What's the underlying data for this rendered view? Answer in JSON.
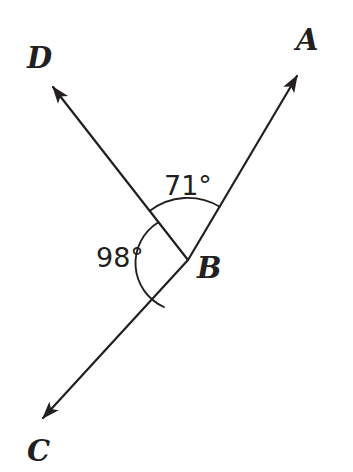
{
  "figure": {
    "type": "angle-diagram",
    "background_color": "#ffffff",
    "stroke_color": "#231f20",
    "stroke_width": 2.2
  },
  "points": {
    "vertex": {
      "label": "B",
      "x": 188,
      "y": 260
    },
    "a": {
      "label": "A",
      "x": 302,
      "y": 68
    },
    "d": {
      "label": "D",
      "x": 47,
      "y": 80
    },
    "c": {
      "label": "C",
      "x": 37,
      "y": 425
    }
  },
  "rays": [
    {
      "name": "ray-BA",
      "from": "B",
      "to": "A",
      "arrowhead": true
    },
    {
      "name": "ray-BD",
      "from": "B",
      "to": "D",
      "arrowhead": true
    },
    {
      "name": "ray-BC",
      "from": "B",
      "to": "C",
      "arrowhead": true
    }
  ],
  "angles": [
    {
      "name": "angle-DBA",
      "label": "71°",
      "value": 71,
      "unit": "degrees",
      "between": [
        "ray-BD",
        "ray-BA"
      ],
      "arc_radius": 62
    },
    {
      "name": "angle-DBC",
      "label": "98°",
      "value": 98,
      "unit": "degrees",
      "between": [
        "ray-BD",
        "ray-BC"
      ],
      "arc_radius": 48
    }
  ],
  "labels": {
    "point_a": "A",
    "point_b": "B",
    "point_c": "C",
    "point_d": "D",
    "angle_71": "71°",
    "angle_98": "98°"
  }
}
